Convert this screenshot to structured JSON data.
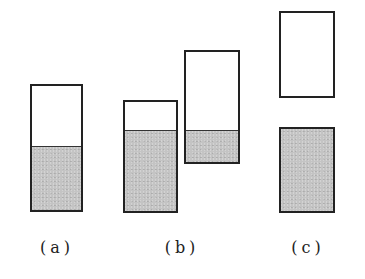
{
  "figure": {
    "panels": [
      {
        "label": "(a)",
        "containers": [
          {
            "x": 30,
            "y": 84,
            "w": 53,
            "h": 128,
            "fill_fraction": 0.5
          }
        ]
      },
      {
        "label": "(b)",
        "containers": [
          {
            "x": 123,
            "y": 100,
            "w": 55,
            "h": 113,
            "fill_fraction": 0.73
          },
          {
            "x": 184,
            "y": 50,
            "w": 56,
            "h": 114,
            "fill_fraction": 0.28
          }
        ]
      },
      {
        "label": "(c)",
        "containers": [
          {
            "x": 279,
            "y": 11,
            "w": 56,
            "h": 87,
            "fill_fraction": 0.0
          },
          {
            "x": 279,
            "y": 127,
            "w": 56,
            "h": 86,
            "fill_fraction": 1.0
          }
        ]
      }
    ],
    "colors": {
      "border": "#222222",
      "fill": "#c4c4c4",
      "empty": "#ffffff"
    }
  }
}
